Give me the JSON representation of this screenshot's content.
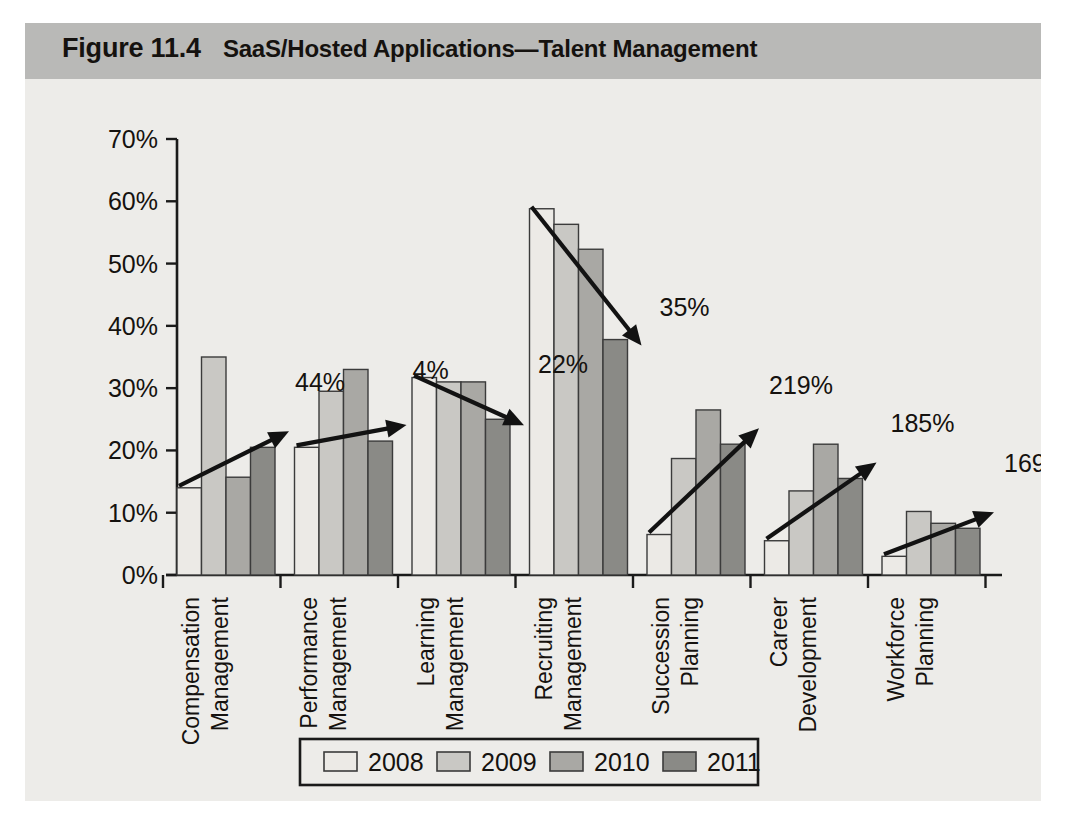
{
  "figure": {
    "number": "Figure 11.4",
    "title": "SaaS/Hosted Applications—Talent Management",
    "band_color": "#b9b9b7",
    "body_color": "#edece9"
  },
  "legend": {
    "items": [
      {
        "label": "2008",
        "color": "#eceae6"
      },
      {
        "label": "2009",
        "color": "#c9c8c4"
      },
      {
        "label": "2010",
        "color": "#a9a8a4"
      },
      {
        "label": "2011",
        "color": "#8a8a86"
      }
    ]
  },
  "chart_data": {
    "type": "bar",
    "title": "SaaS/Hosted Applications—Talent Management",
    "xlabel": "",
    "ylabel": "",
    "ylim": [
      0,
      70
    ],
    "ytick_labels": [
      "0%",
      "10%",
      "20%",
      "30%",
      "40%",
      "50%",
      "60%",
      "70%"
    ],
    "ytick_values": [
      0,
      10,
      20,
      30,
      40,
      50,
      60,
      70
    ],
    "grid": false,
    "legend_position": "bottom",
    "categories": [
      "Compensation Management",
      "Performance Management",
      "Learning Management",
      "Recruiting Management",
      "Succession Planning",
      "Career Development",
      "Workforce Planning"
    ],
    "category_lines": [
      [
        "Compensation",
        "Management"
      ],
      [
        "Performance",
        "Management"
      ],
      [
        "Learning",
        "Management"
      ],
      [
        "Recruiting",
        "Management"
      ],
      [
        "Succession",
        "Planning"
      ],
      [
        "Career",
        "Development"
      ],
      [
        "Workforce",
        "Planning"
      ]
    ],
    "series": [
      {
        "name": "2008",
        "color": "#eceae6",
        "values": [
          14.0,
          20.5,
          31.7,
          58.8,
          6.5,
          5.5,
          3.0
        ]
      },
      {
        "name": "2009",
        "color": "#c9c8c4",
        "values": [
          35.0,
          29.5,
          31.0,
          56.3,
          18.7,
          13.5,
          10.2
        ]
      },
      {
        "name": "2010",
        "color": "#a9a8a4",
        "values": [
          15.7,
          33.0,
          31.0,
          52.3,
          26.5,
          21.0,
          8.3
        ]
      },
      {
        "name": "2011",
        "color": "#8a8a86",
        "values": [
          20.5,
          21.5,
          25.0,
          37.8,
          21.0,
          15.5,
          7.5
        ]
      }
    ],
    "annotations": [
      {
        "text": "44%",
        "category": "Compensation Management",
        "direction": "up"
      },
      {
        "text": "4%",
        "category": "Performance Management",
        "direction": "up"
      },
      {
        "text": "22%",
        "category": "Learning Management",
        "direction": "down"
      },
      {
        "text": "35%",
        "category": "Recruiting Management",
        "direction": "down"
      },
      {
        "text": "219%",
        "category": "Succession Planning",
        "direction": "up"
      },
      {
        "text": "185%",
        "category": "Career Development",
        "direction": "up"
      },
      {
        "text": "169%",
        "category": "Workforce Planning",
        "direction": "up"
      }
    ]
  }
}
